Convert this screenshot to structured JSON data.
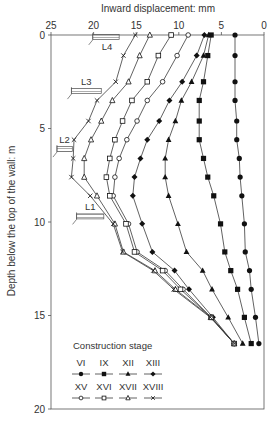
{
  "chart_data": {
    "type": "line",
    "title": "",
    "xlabel": "Inward displacement: mm",
    "ylabel": "Depth below the top of the wall: m",
    "xlim": [
      25,
      0
    ],
    "ylim": [
      20,
      0
    ],
    "x_reversed": true,
    "y_reversed": true,
    "xticks": [
      "25",
      "20",
      "15",
      "10",
      "5",
      "0"
    ],
    "yticks": [
      "0",
      "5",
      "10",
      "15",
      "20"
    ],
    "grid": false,
    "legend_title": "Construction stage",
    "legend_position": "lower-left inside",
    "depths": [
      0,
      1.1,
      2.5,
      3.5,
      4.6,
      5.6,
      6.6,
      7.6,
      8.6,
      10.1,
      11.6,
      12.6,
      13.6,
      15.1,
      16.5
    ],
    "series": [
      {
        "name": "VI",
        "marker": "filled-circle",
        "values": [
          3.4,
          3.4,
          3.4,
          3.4,
          3.2,
          3.2,
          2.9,
          2.8,
          2.6,
          2.3,
          2.2,
          1.7,
          1.5,
          1.0,
          0.6
        ]
      },
      {
        "name": "IX",
        "marker": "filled-square",
        "values": [
          6.2,
          6.6,
          7.1,
          7.6,
          7.6,
          7.6,
          7.1,
          6.6,
          5.9,
          5.1,
          4.6,
          3.9,
          3.1,
          2.3,
          1.5
        ]
      },
      {
        "name": "XII",
        "marker": "filled-triangle",
        "values": [
          6.5,
          7.1,
          8.5,
          9.7,
          10.4,
          11.2,
          11.6,
          11.6,
          11.2,
          10.1,
          9.1,
          7.2,
          6.1,
          4.2,
          2.5
        ]
      },
      {
        "name": "XIII",
        "marker": "filled-diamond",
        "values": [
          7.0,
          7.9,
          9.6,
          11.1,
          12.3,
          13.7,
          14.5,
          15.2,
          15.4,
          14.3,
          13.1,
          10.5,
          8.8,
          6.0,
          3.5
        ]
      },
      {
        "name": "XV",
        "marker": "open-circle",
        "values": [
          8.9,
          10.2,
          11.9,
          13.7,
          14.9,
          16.1,
          17.0,
          17.5,
          17.7,
          15.9,
          14.9,
          11.6,
          9.5,
          6.2,
          3.5
        ]
      },
      {
        "name": "XVI",
        "marker": "open-square",
        "values": [
          10.9,
          12.4,
          13.7,
          15.5,
          16.6,
          17.5,
          18.1,
          18.5,
          18.1,
          16.2,
          15.2,
          11.9,
          9.8,
          6.2,
          3.5
        ]
      },
      {
        "name": "XVII",
        "marker": "open-triangle",
        "values": [
          13.4,
          14.6,
          15.9,
          17.8,
          19.1,
          20.3,
          21.1,
          21.1,
          19.6,
          17.5,
          16.5,
          12.8,
          10.4,
          6.2,
          3.5
        ]
      },
      {
        "name": "XVIII",
        "marker": "cross",
        "values": [
          15.1,
          16.5,
          17.4,
          19.6,
          20.6,
          22.3,
          22.4,
          22.6,
          20.4,
          17.7,
          16.6,
          13.0,
          10.6,
          6.3,
          3.5
        ]
      }
    ],
    "annotations": [
      {
        "label": "L4",
        "depth": 0.1,
        "x_from": 17.0,
        "x_to": 20.1
      },
      {
        "label": "L3",
        "depth": 3.0,
        "x_from": 19.1,
        "x_to": 22.6
      },
      {
        "label": "L2",
        "depth": 6.1,
        "x_from": 22.5,
        "x_to": 24.3
      },
      {
        "label": "L1",
        "depth": 9.7,
        "x_from": 18.8,
        "x_to": 22.0
      }
    ]
  },
  "colors": {
    "line": "#3a3a3a",
    "marker": "#111111",
    "axis": "#555555",
    "text": "#333333",
    "hatch": "#777777",
    "background": "#ffffff"
  }
}
